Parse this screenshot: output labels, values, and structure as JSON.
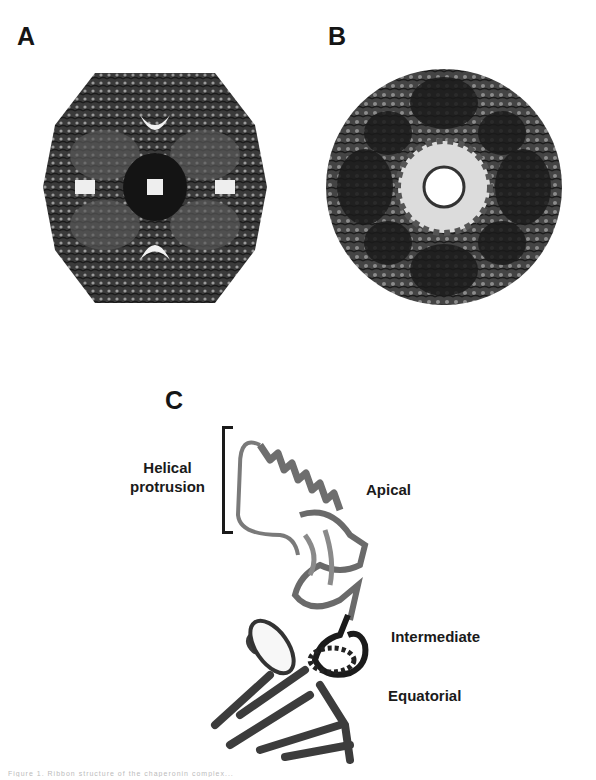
{
  "figure": {
    "panels": [
      {
        "label": "A",
        "description": "Side view of double-ring chaperonin complex (ribbon)"
      },
      {
        "label": "B",
        "description": "Top view of chaperonin ring showing central cavity (ribbon)"
      },
      {
        "label": "C",
        "description": "Single subunit ribbon structure with domain annotations"
      }
    ],
    "annotations": {
      "helical_protrusion": [
        "Helical",
        "protrusion"
      ],
      "apical": "Apical",
      "intermediate": "Intermediate",
      "equatorial": "Equatorial"
    },
    "colors": {
      "background": "#ffffff",
      "dark_ribbon": "#1e1e1e",
      "mid_ribbon": "#4a4a4a",
      "light_ribbon": "#7a7a7a",
      "text": "#151515"
    },
    "caption": "Figure 1. Ribbon structure of the chaperonin complex..."
  }
}
